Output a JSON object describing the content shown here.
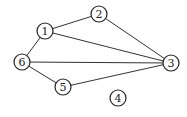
{
  "diagram": {
    "type": "undirected-graph",
    "nodes": [
      {
        "id": "1",
        "label": "1",
        "x": 45,
        "y": 31
      },
      {
        "id": "2",
        "label": "2",
        "x": 99,
        "y": 14
      },
      {
        "id": "3",
        "label": "3",
        "x": 171,
        "y": 63
      },
      {
        "id": "4",
        "label": "4",
        "x": 118,
        "y": 98
      },
      {
        "id": "5",
        "label": "5",
        "x": 63,
        "y": 87
      },
      {
        "id": "6",
        "label": "6",
        "x": 22,
        "y": 62
      }
    ],
    "edges": [
      {
        "from": "1",
        "to": "2"
      },
      {
        "from": "1",
        "to": "3"
      },
      {
        "from": "1",
        "to": "6"
      },
      {
        "from": "2",
        "to": "3"
      },
      {
        "from": "6",
        "to": "3"
      },
      {
        "from": "6",
        "to": "5"
      },
      {
        "from": "5",
        "to": "3"
      }
    ],
    "node_radius": 8,
    "colors": {
      "stroke": "#222222",
      "edge": "#333333",
      "background": "#ffffff"
    }
  }
}
